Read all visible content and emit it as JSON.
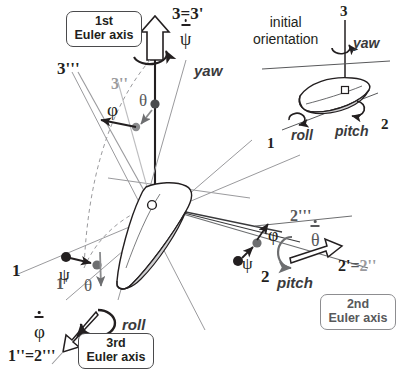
{
  "figure": {
    "background": "#ffffff",
    "colors": {
      "dark": "#231f20",
      "mid": "#58595b",
      "light": "#9a9a9d",
      "hull_fill": "#d4d4d6",
      "box_border": "#4a4a4c"
    }
  },
  "boxes": {
    "first": {
      "line1": "1st",
      "line2": "Euler axis"
    },
    "second": {
      "line1": "2nd",
      "line2": "Euler axis"
    },
    "third": {
      "line1": "3rd",
      "line2": "Euler axis"
    }
  },
  "inset": {
    "caption_line1": "initial",
    "caption_line2": "orientation",
    "axis_3": "3",
    "axis_1": "1",
    "axis_2": "2",
    "yaw": "yaw",
    "roll": "roll",
    "pitch": "pitch"
  },
  "main": {
    "axis_3_eq_3p": "3=3'",
    "axis_3ppp": "3'''",
    "axis_3pp": "3''",
    "axis_1": "1",
    "axis_1p": "1'",
    "axis_2": "2",
    "axis_2ppp": "2'''",
    "axis_2p": "2'",
    "axis_2pp": "2''",
    "axis_eq": "=",
    "axis_1pp_eq_2ppp_a": "1''",
    "axis_1pp_eq_2ppp_eq": "=",
    "axis_1pp_eq_2ppp_b": "2'''",
    "yaw": "yaw",
    "pitch": "pitch",
    "roll": "roll",
    "phi_top": "φ",
    "theta_top": "θ",
    "psi_left": "ψ",
    "theta_left": "θ",
    "phi_right": "φ",
    "psi_right": "ψ",
    "psi_dot": "ψ",
    "theta_dot": "θ",
    "phi_dot": "φ"
  }
}
